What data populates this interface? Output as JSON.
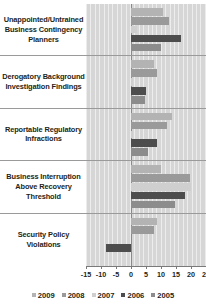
{
  "chart_data": {
    "type": "bar",
    "orientation": "horizontal",
    "title": "",
    "xlabel": "",
    "ylabel": "",
    "xlim": [
      -15,
      25
    ],
    "xticks": [
      -15,
      -10,
      -5,
      0,
      5,
      10,
      15,
      20,
      25
    ],
    "xtick_labels": [
      "-15",
      "-10",
      "-5",
      "0",
      "5",
      "10",
      "15",
      "20",
      "25"
    ],
    "grid": true,
    "legend_position": "bottom",
    "categories": [
      "Unappointed/Untrained Business Contingency Planners",
      "Derogatory Background Investigation Findings",
      "Reportable Regulatory Infractions",
      "Business Interruption Above Recovery Threshold",
      "Security Policy Violations"
    ],
    "series": [
      {
        "name": "2009",
        "color": "#b3b3b3",
        "values": [
          10.5,
          7.5,
          13.5,
          10.0,
          8.5
        ]
      },
      {
        "name": "2008",
        "color": "#9a9a9a",
        "values": [
          12.5,
          8.5,
          12.0,
          19.5,
          7.5
        ]
      },
      {
        "name": "2007",
        "color": "#cfcfcf",
        "values": [
          2.0,
          0.5,
          0.5,
          20.0,
          0.0
        ]
      },
      {
        "name": "2006",
        "color": "#4d4d4d",
        "values": [
          16.5,
          5.0,
          8.5,
          18.0,
          -8.5
        ]
      },
      {
        "name": "2005",
        "color": "#8c8c8c",
        "values": [
          10.0,
          4.5,
          5.5,
          14.5,
          0.0
        ]
      }
    ]
  },
  "legend": {
    "items": [
      {
        "label": "2009",
        "color": "#b3b3b3"
      },
      {
        "label": "2008",
        "color": "#9a9a9a"
      },
      {
        "label": "2007",
        "color": "#cfcfcf"
      },
      {
        "label": "2006",
        "color": "#4d4d4d"
      },
      {
        "label": "2005",
        "color": "#8c8c8c"
      }
    ]
  },
  "colors": {
    "plot_background": "#d6d6d6",
    "gridline": "#ffffff",
    "axis": "#7a7a7a",
    "text": "#231f20"
  }
}
